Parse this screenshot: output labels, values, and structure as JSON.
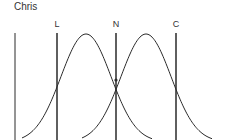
{
  "title": "Chris",
  "lines": [
    {
      "id": "L",
      "label": "L"
    },
    {
      "id": "N",
      "label": "N"
    },
    {
      "id": "C",
      "label": "C"
    }
  ],
  "curves": [
    {
      "name": "left-bell-curve"
    },
    {
      "name": "right-bell-curve"
    }
  ],
  "colors": {
    "stroke": "#2a2a2a",
    "text": "#333333"
  }
}
